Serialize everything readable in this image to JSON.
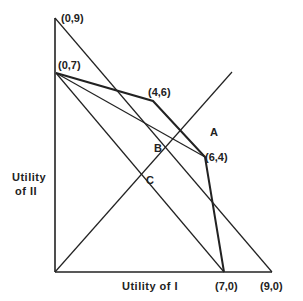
{
  "diagram": {
    "x_axis_label": "Utility of I",
    "y_axis_label_line1": "Utility",
    "y_axis_label_line2": "of II",
    "points": {
      "p09": "(0,9)",
      "p07": "(0,7)",
      "p46": "(4,6)",
      "p64": "(6,4)",
      "p70": "(7,0)",
      "p90": "(9,0)"
    },
    "intersections": {
      "A": "A",
      "B": "B",
      "C": "C"
    },
    "colors": {
      "line": "#222222",
      "background": "#ffffff"
    }
  }
}
